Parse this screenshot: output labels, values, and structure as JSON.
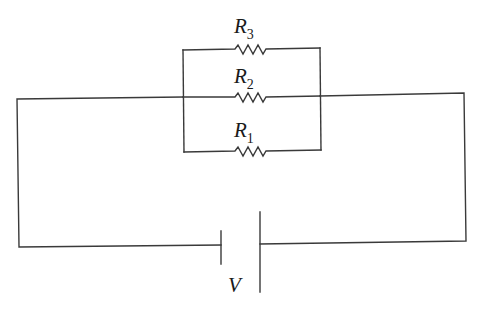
{
  "diagram": {
    "type": "circuit",
    "components": {
      "resistors": [
        {
          "id": "R1",
          "label": "R",
          "subscript": "1",
          "position": "bottom branch"
        },
        {
          "id": "R2",
          "label": "R",
          "subscript": "2",
          "position": "middle branch"
        },
        {
          "id": "R3",
          "label": "R",
          "subscript": "3",
          "position": "top branch"
        }
      ],
      "battery": {
        "label": "V"
      }
    },
    "colors": {
      "wire": "#3a3a3a",
      "background": "#ffffff",
      "text": "#1a1a1a"
    }
  }
}
